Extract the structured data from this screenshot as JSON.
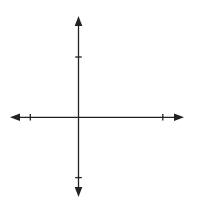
{
  "diagram": {
    "type": "coordinate-plane",
    "axes": {
      "x_label": "x",
      "y_label": "y",
      "x_ticks_labeled": [
        {
          "value": -4,
          "label": "-4"
        },
        {
          "value": 7,
          "label": "7"
        }
      ],
      "y_ticks_labeled": [
        {
          "value": 5,
          "label": "5"
        },
        {
          "value": -5,
          "label": "-5"
        }
      ],
      "grid_spacing": 1
    },
    "triangle": {
      "vertices": [
        {
          "x": 4,
          "y": 3
        },
        {
          "x": 6,
          "y": -1
        },
        {
          "x": 3,
          "y": -2
        }
      ]
    },
    "colors": {
      "grid": "#c8c8c8",
      "axis": "#222222",
      "shape": "#222222"
    }
  }
}
